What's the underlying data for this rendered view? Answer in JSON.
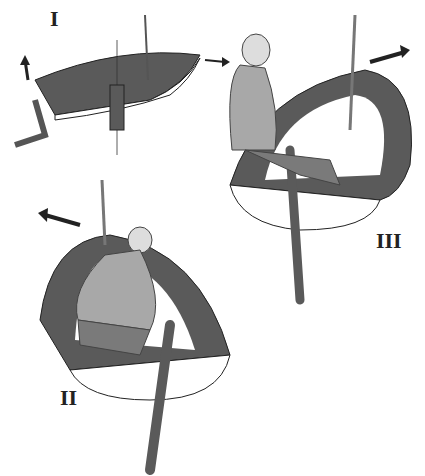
{
  "figure": {
    "panels": [
      {
        "label": "I",
        "description": "Dinghy from above with rudder and arrows showing direction"
      },
      {
        "label": "II",
        "description": "Sailor steering with tiller, boat turning left"
      },
      {
        "label": "III",
        "description": "Sailor seated with tiller, boat turning right"
      }
    ]
  },
  "colors": {
    "hull_dark": "#5a5a5a",
    "hull_light": "#ffffff",
    "person": "#a8a8a8",
    "trousers": "#7a7a7a",
    "outline": "#222222"
  }
}
